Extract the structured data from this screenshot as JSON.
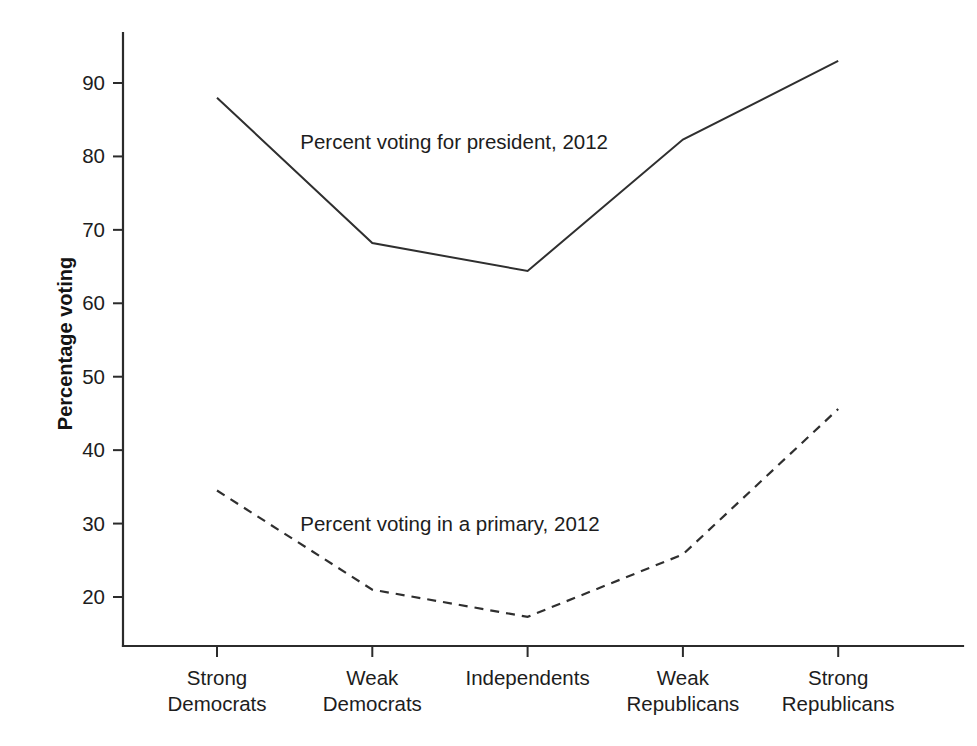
{
  "chart_data": {
    "type": "line",
    "title": "",
    "subtitle": "",
    "xlabel": "",
    "ylabel": "Percentage voting",
    "categories": [
      "Strong Democrats",
      "Weak Democrats",
      "Independents",
      "Weak Republicans",
      "Strong Republicans"
    ],
    "category_lines": [
      [
        "Strong",
        "Democrats"
      ],
      [
        "Weak",
        "Democrats"
      ],
      [
        "Independents",
        ""
      ],
      [
        "Weak",
        "Republicans"
      ],
      [
        "Strong",
        "Republicans"
      ]
    ],
    "series": [
      {
        "name": "Percent voting for president, 2012",
        "style": "solid",
        "values": [
          88,
          68.2,
          64.4,
          82.3,
          93
        ]
      },
      {
        "name": "Percent voting in a primary, 2012",
        "style": "dashed",
        "values": [
          34.5,
          21,
          17.3,
          25.8,
          45.6
        ]
      }
    ],
    "annotations": [
      {
        "text": "Percent voting for president, 2012",
        "x_category": "Weak Democrats",
        "y_value": 82
      },
      {
        "text": "Percent voting in a primary, 2012",
        "x_category": "Weak Democrats",
        "y_value": 30
      }
    ],
    "ylim": [
      14,
      96
    ],
    "yticks": [
      20,
      30,
      40,
      50,
      60,
      70,
      80,
      90
    ],
    "ytick_labels": [
      "20",
      "30",
      "40",
      "50",
      "60",
      "70",
      "80",
      "90"
    ],
    "grid": false,
    "legend": "inline-annotations",
    "line_color": "#2f2f2f",
    "background_color": "#ffffff"
  }
}
